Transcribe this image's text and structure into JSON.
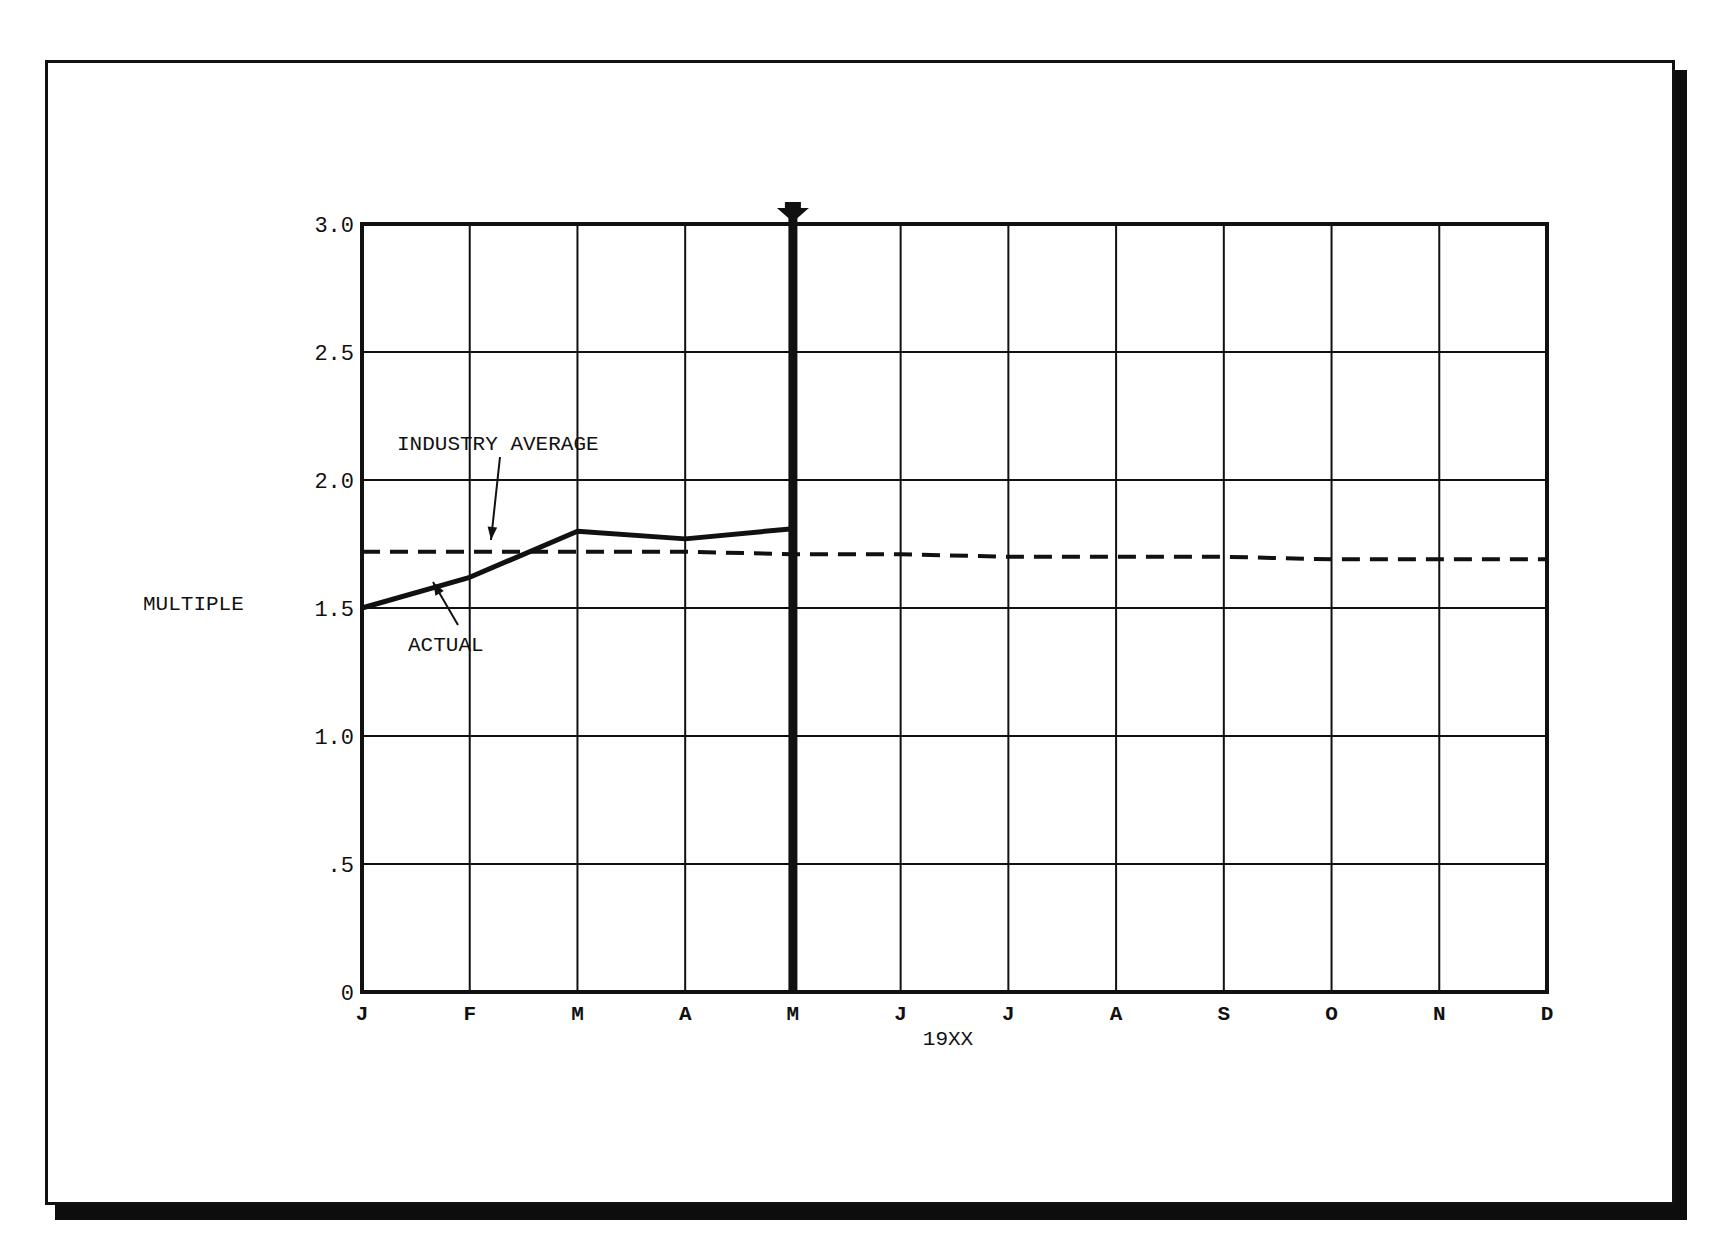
{
  "chart_data": {
    "type": "line",
    "title": "",
    "xlabel": "19XX",
    "ylabel": "MULTIPLE",
    "ylim": [
      0,
      3.0
    ],
    "yticks": [
      "0",
      ".5",
      "1.0",
      "1.5",
      "2.0",
      "2.5",
      "3.0"
    ],
    "ytick_values": [
      0,
      0.5,
      1.0,
      1.5,
      2.0,
      2.5,
      3.0
    ],
    "categories": [
      "J",
      "F",
      "M",
      "A",
      "M",
      "J",
      "J",
      "A",
      "S",
      "O",
      "N",
      "D"
    ],
    "grid": true,
    "current_month_marker": {
      "index": 4,
      "label": "M"
    },
    "series": [
      {
        "name": "ACTUAL",
        "style": "solid",
        "values": [
          1.5,
          1.62,
          1.8,
          1.77,
          1.81,
          null,
          null,
          null,
          null,
          null,
          null,
          null
        ]
      },
      {
        "name": "INDUSTRY AVERAGE",
        "style": "dashed",
        "values": [
          1.72,
          1.72,
          1.72,
          1.72,
          1.71,
          1.71,
          1.7,
          1.7,
          1.7,
          1.69,
          1.69,
          1.69
        ]
      }
    ],
    "annotations": [
      {
        "text": "INDUSTRY AVERAGE",
        "points_to": "INDUSTRY AVERAGE"
      },
      {
        "text": "ACTUAL",
        "points_to": "ACTUAL"
      }
    ]
  }
}
